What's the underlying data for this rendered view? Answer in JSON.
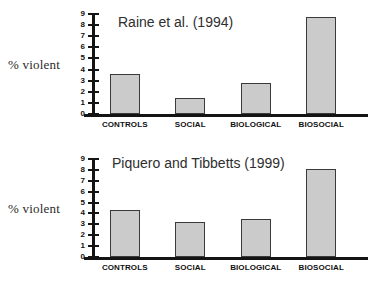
{
  "axis_title": "% violent",
  "chart_data": [
    {
      "type": "bar",
      "title": "Raine et al. (1994)",
      "xlabel": "",
      "ylabel": "% violent",
      "categories": [
        "CONTROLS",
        "SOCIAL",
        "BIOLOGICAL",
        "BIOSOCIAL"
      ],
      "values": [
        3.6,
        1.4,
        2.8,
        8.7
      ],
      "ylim": [
        0,
        9
      ],
      "yticks": [
        0,
        1,
        2,
        3,
        4,
        5,
        6,
        7,
        8,
        9
      ],
      "grid": false,
      "legend": "none",
      "bar_color": "#cbcbcb",
      "bar_edge_color": "#3a3a3a"
    },
    {
      "type": "bar",
      "title": "Piquero and Tibbetts (1999)",
      "xlabel": "",
      "ylabel": "% violent",
      "categories": [
        "CONTROLS",
        "SOCIAL",
        "BIOLOGICAL",
        "BIOSOCIAL"
      ],
      "values": [
        4.3,
        3.25,
        3.45,
        8.05
      ],
      "ylim": [
        0,
        9
      ],
      "yticks": [
        0,
        1,
        2,
        3,
        4,
        5,
        6,
        7,
        8,
        9
      ],
      "grid": false,
      "legend": "none",
      "bar_color": "#cbcbcb",
      "bar_edge_color": "#3a3a3a"
    }
  ]
}
